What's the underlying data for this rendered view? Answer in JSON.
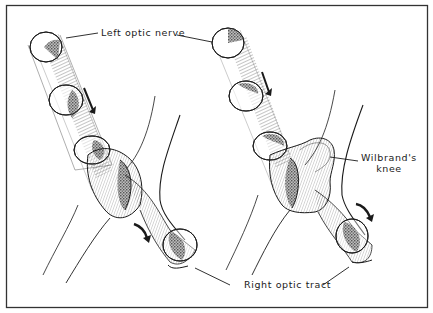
{
  "figure": {
    "type": "anatomical-diagram",
    "frame_color": "#333333",
    "ink_color": "#1a1a1a",
    "background": "#ffffff"
  },
  "labels": {
    "left_optic_nerve": "Left optic nerve",
    "wilbrands_knee_line1": "Wilbrand's",
    "wilbrands_knee_line2": "knee",
    "right_optic_tract": "Right optic tract"
  },
  "panels": [
    {
      "id": "left",
      "description": "Straight crossing of nasal fibers from left optic nerve into right optic tract",
      "arrows": [
        "down-right along nerve",
        "curved arrow along tract"
      ]
    },
    {
      "id": "right",
      "description": "Crossing fibers loop forward into contralateral nerve forming Wilbrand's knee",
      "arrows": [
        "down-right along nerve",
        "curved arrow along tract"
      ]
    }
  ]
}
